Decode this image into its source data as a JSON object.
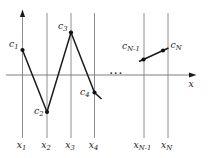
{
  "figure": {
    "canvas": {
      "width": 208,
      "height": 158,
      "background": "#ffffff"
    },
    "colors": {
      "grid_line": "#818181",
      "axis_line": "#6f6f6f",
      "curve": "#1a1a1a",
      "point": "#111111",
      "text": "#1c1c1c"
    },
    "x_axis": {
      "y": 75,
      "x_start": 6,
      "x_end": 191,
      "arrow_tip_x": 196.5,
      "label": "x",
      "label_x": 188.5,
      "label_y": 86.5
    },
    "y_axis": {
      "x": 22.5,
      "arrow_tip_y": 9.5,
      "arrow_base_y": 17
    },
    "grid": {
      "top_y": 13,
      "bottom_y": 138
    },
    "ticks": [
      {
        "x": 22.5,
        "base": "x",
        "sub": "1",
        "label_x": 21.5,
        "label_y": 147.5
      },
      {
        "x": 47,
        "base": "x",
        "sub": "2",
        "label_x": 46,
        "label_y": 147.5
      },
      {
        "x": 71,
        "base": "x",
        "sub": "3",
        "label_x": 70,
        "label_y": 147.5
      },
      {
        "x": 94.5,
        "base": "x",
        "sub": "4",
        "label_x": 93.5,
        "label_y": 147.5
      },
      {
        "x": 144,
        "base": "x",
        "sub": "N-1",
        "label_x": 142.5,
        "label_y": 147.5
      },
      {
        "x": 168,
        "base": "x",
        "sub": "N",
        "label_x": 166.5,
        "label_y": 147.5
      }
    ],
    "points": [
      {
        "x": 22.5,
        "y": 50,
        "base": "c",
        "sub": "1",
        "label_x": 9,
        "label_y": 47
      },
      {
        "x": 47,
        "y": 112,
        "base": "c",
        "sub": "2",
        "label_x": 34,
        "label_y": 113.5
      },
      {
        "x": 71,
        "y": 32.5,
        "base": "c",
        "sub": "3",
        "label_x": 58,
        "label_y": 29
      },
      {
        "x": 94.5,
        "y": 92.5,
        "base": "c",
        "sub": "4",
        "label_x": 80,
        "label_y": 95
      },
      {
        "x": 143.5,
        "y": 59.5,
        "base": "c",
        "sub": "N-1",
        "label_x": 122,
        "label_y": 48.5
      },
      {
        "x": 163,
        "y": 50.5,
        "base": "c",
        "sub": "N",
        "label_x": 170.5,
        "label_y": 48
      }
    ],
    "segments": [
      {
        "name": "curve-segment-left",
        "points": [
          [
            22.5,
            50
          ],
          [
            47,
            112
          ],
          [
            71,
            32.5
          ],
          [
            94.5,
            92.5
          ],
          [
            101.5,
            99
          ]
        ]
      },
      {
        "name": "curve-segment-right",
        "points": [
          [
            139,
            61.5
          ],
          [
            168.5,
            48
          ]
        ]
      }
    ],
    "ellipsis": {
      "text": "...",
      "x": 109.5,
      "y": 74
    },
    "point_radius": 2.1,
    "font": {
      "main_size": 9.3,
      "sub_size": 6.8,
      "sub_dy": 2.3
    }
  }
}
